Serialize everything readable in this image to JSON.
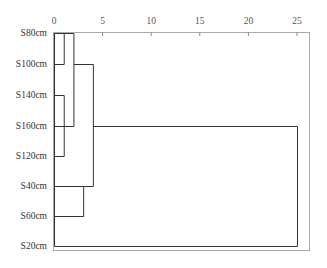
{
  "chart_data": {
    "type": "dendrogram",
    "title": "",
    "xlabel": "",
    "ylabel": "",
    "xlim": [
      0,
      25
    ],
    "x_ticks": [
      0,
      5,
      10,
      15,
      20,
      25
    ],
    "x_tick_labels": [
      "0",
      "5",
      "10",
      "15",
      "20",
      "25"
    ],
    "leaves": [
      "S80cm",
      "S100cm",
      "S140cm",
      "S160cm",
      "S120cm",
      "S40cm",
      "S60cm",
      "S20cm"
    ],
    "merges": [
      {
        "members": [
          "S80cm",
          "S100cm"
        ],
        "distance": 1
      },
      {
        "members": [
          "S140cm",
          "S120cm"
        ],
        "distance": 1
      },
      {
        "members": [
          "S80cm",
          "S100cm",
          "S140cm",
          "S120cm",
          "S160cm"
        ],
        "distance": 2
      },
      {
        "members": [
          "S40cm",
          "S60cm"
        ],
        "distance": 3
      },
      {
        "members": [
          "S80cm",
          "S100cm",
          "S140cm",
          "S160cm",
          "S120cm",
          "S40cm",
          "S60cm"
        ],
        "distance": 4
      },
      {
        "members": [
          "S80cm",
          "S100cm",
          "S140cm",
          "S160cm",
          "S120cm",
          "S40cm",
          "S60cm",
          "S20cm"
        ],
        "distance": 25
      }
    ],
    "grid": false,
    "legend": null,
    "colors": {
      "line": "#333333",
      "frame": "#999999",
      "text": "#444444"
    }
  }
}
